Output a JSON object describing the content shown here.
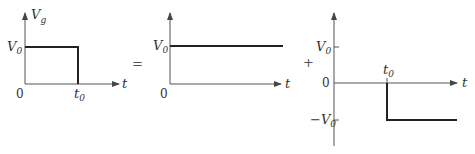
{
  "equation": {
    "equals_symbol": "=",
    "plus_symbol": "+"
  },
  "panels": [
    {
      "id": "pulse",
      "y_axis_label": "V",
      "y_axis_label_sub": "g",
      "x_axis_label": "t",
      "level_label": "V",
      "level_label_sub": "0",
      "origin_label": "0",
      "time_label": "t",
      "time_label_sub": "0"
    },
    {
      "id": "step-up",
      "x_axis_label": "t",
      "level_label": "V",
      "level_label_sub": "0",
      "origin_label": "0"
    },
    {
      "id": "delayed-step-down",
      "x_axis_label": "t",
      "pos_level_label": "V",
      "pos_level_label_sub": "0",
      "origin_label": "0",
      "neg_level_label": "−V",
      "neg_level_label_sub": "0",
      "time_label": "t",
      "time_label_sub": "0"
    }
  ],
  "colors": {
    "axis": "#555555",
    "signal": "#222222"
  }
}
